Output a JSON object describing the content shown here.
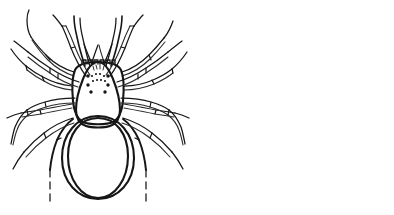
{
  "figure": {
    "background_color": "#ffffff",
    "ink_color": "#161616",
    "width": 394,
    "height": 215,
    "style": "black ink line drawing, scientific illustration, no shading",
    "caption": "",
    "panel_count": 2
  },
  "panels": [
    {
      "id": "spider-left",
      "name": "left-spider",
      "label": "",
      "position": "left",
      "description": "Spider seen from above with rounded-rectangular cephalothorax, eight legs, oval abdomen and a pair of raised pedipalps forming a V above the head",
      "anatomy": {
        "cephalothorax_shape": "rounded rectangle",
        "abdomen_shape": "tall oval",
        "eye_count": 6,
        "eye_arrangement": "two vertical groups of three",
        "leg_count": 8,
        "pedipalps": "two long curved palps raised above head forming a V",
        "chelicerae": "row of small square teeth across front margin of head"
      }
    },
    {
      "id": "spider-right",
      "name": "right-spider",
      "label": "",
      "position": "right",
      "description": "Spider seen from above with pointed triangular cephalothorax, eight slender jointed legs spread outward and a broad rounded abdomen",
      "anatomy": {
        "cephalothorax_shape": "pointed triangular dome",
        "abdomen_shape": "broad rounded oval",
        "eye_count": 8,
        "eye_arrangement": "single arc row of small dots at the apex",
        "leg_count": 8,
        "pedipalps": "two short palps flanking the head apex",
        "chelicerae": "small dotted fringe at head apex"
      }
    }
  ]
}
